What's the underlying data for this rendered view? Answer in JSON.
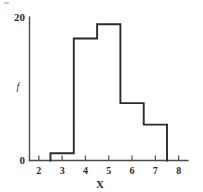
{
  "chart_data": {
    "type": "bar",
    "title": "",
    "subtitle": "",
    "xlabel": "X",
    "ylabel": "f",
    "categories": [
      "2.5-3.5",
      "3.5-4.5",
      "4.5-5.5",
      "5.5-6.5",
      "6.5-7.5"
    ],
    "bin_edges": [
      2.5,
      3.5,
      4.5,
      5.5,
      6.5,
      7.5
    ],
    "values": [
      1,
      17,
      19,
      8,
      5
    ],
    "xlim": [
      1.6,
      8.4
    ],
    "ylim": [
      0,
      20
    ],
    "xticks": [
      2,
      3,
      4,
      5,
      6,
      7,
      8
    ],
    "xtick_labels": [
      "2",
      "3",
      "4",
      "5",
      "6",
      "7",
      "8"
    ],
    "yticks": [
      0,
      20
    ],
    "ytick_labels": [
      "0",
      "20"
    ],
    "grid": false,
    "legend": false,
    "legend_position": "none",
    "style": "histogram outline, unfilled",
    "line_color": "#2b2b2b",
    "axis_color": "#4a4a4a",
    "background": "#ffffff"
  },
  "labels": {
    "y_top": "20",
    "y_zero": "0",
    "y_axis_title": "f",
    "x_axis_title": "X",
    "x_tick_2": "2",
    "x_tick_3": "3",
    "x_tick_4": "4",
    "x_tick_5": "5",
    "x_tick_6": "6",
    "x_tick_7": "7",
    "x_tick_8": "8"
  }
}
